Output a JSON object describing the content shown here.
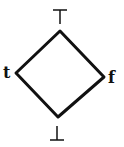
{
  "diagram": {
    "type": "hasse-lattice",
    "nodes": [
      {
        "id": "top",
        "label": "⊤"
      },
      {
        "id": "t",
        "label": "t"
      },
      {
        "id": "f",
        "label": "f"
      },
      {
        "id": "bottom",
        "label": "⊥"
      }
    ],
    "edges": [
      [
        "top",
        "t"
      ],
      [
        "top",
        "f"
      ],
      [
        "t",
        "bottom"
      ],
      [
        "f",
        "bottom"
      ]
    ],
    "stroke_color": "#111111"
  }
}
